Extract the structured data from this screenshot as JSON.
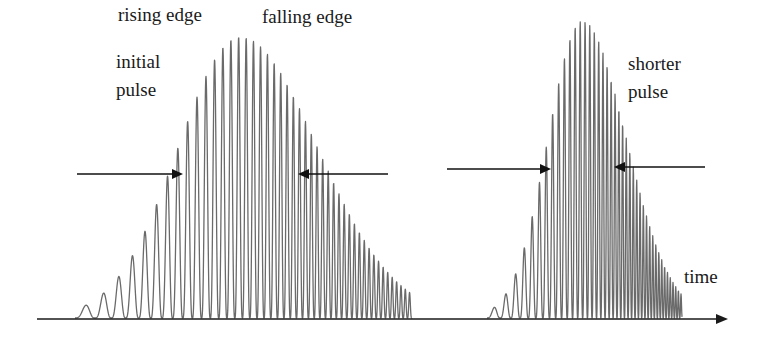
{
  "diagram": {
    "colors": {
      "background": "#ffffff",
      "waveform": "#6a6a6a",
      "axis": "#1a1a1a",
      "arrow": "#111111",
      "text": "#1a1a1a"
    },
    "labels": {
      "rising_edge": "rising edge",
      "falling_edge": "falling edge",
      "initial_pulse": "initial\npulse",
      "shorter_pulse": "shorter\npulse",
      "time": "time"
    },
    "axis": {
      "x1": 37,
      "x2": 728,
      "y": 319,
      "label": "time"
    },
    "pulses": [
      {
        "name": "initial pulse",
        "x_start": 75,
        "x_end": 412,
        "center": 240,
        "peak_y": 38,
        "sigma": 62,
        "skew": 1.25,
        "period_start": 26,
        "period_end": 4.2
      },
      {
        "name": "shorter pulse",
        "x_start": 487,
        "x_end": 682,
        "center": 582,
        "peak_y": 22,
        "sigma": 34,
        "skew": 1.3,
        "period_start": 18,
        "period_end": 2.6
      }
    ],
    "width_markers": [
      {
        "pulse": "initial pulse",
        "side": "left",
        "from_x": 77,
        "to_x": 183,
        "y": 174
      },
      {
        "pulse": "initial pulse",
        "side": "right",
        "from_x": 388,
        "to_x": 298,
        "y": 174
      },
      {
        "pulse": "shorter pulse",
        "side": "left",
        "from_x": 447,
        "to_x": 551,
        "y": 169
      },
      {
        "pulse": "shorter pulse",
        "side": "right",
        "from_x": 705,
        "to_x": 614,
        "y": 167
      }
    ]
  }
}
